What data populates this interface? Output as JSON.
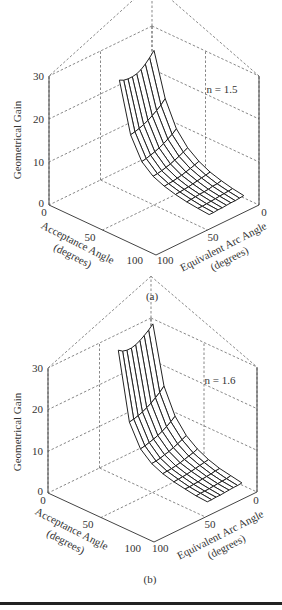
{
  "chart_data": [
    {
      "id": "a",
      "type": "surface3d",
      "caption": "(a)",
      "annotation": "n = 1.5",
      "zlabel": "Geometrical Gain",
      "xlabel": "Acceptance Angle (degrees)",
      "ylabel": "Equivalent Arc Angle (degrees)",
      "zticks": [
        0,
        10,
        20,
        30
      ],
      "xticks": [
        0,
        50,
        100
      ],
      "yticks": [
        0,
        50,
        100
      ],
      "zlim": [
        0,
        30
      ],
      "xlim": [
        0,
        100
      ],
      "ylim": [
        0,
        100
      ],
      "grid": true,
      "acceptance_angles": [
        10,
        20,
        30,
        40,
        50,
        60,
        70,
        80,
        90
      ],
      "arc_angles": [
        0,
        10,
        20,
        30,
        40,
        50,
        60,
        70,
        80
      ],
      "surface_note": "Gain decreases with acceptance angle; ~23 at smallest acceptance, ~11 near 30°, ~2–5 at large acceptance angles",
      "gain_rows": [
        [
          23.0,
          22.5,
          22.3,
          22.3,
          22.5,
          23.0,
          23.8,
          24.8,
          26.0
        ],
        [
          11.5,
          11.7,
          12.0,
          12.4,
          12.9,
          13.5,
          14.2,
          15.0,
          16.0
        ],
        [
          6.5,
          6.7,
          7.0,
          7.3,
          7.7,
          8.2,
          8.8,
          9.4,
          10.2
        ],
        [
          4.3,
          4.4,
          4.6,
          4.9,
          5.2,
          5.6,
          6.0,
          6.5,
          7.0
        ],
        [
          3.2,
          3.3,
          3.4,
          3.6,
          3.8,
          4.1,
          4.4,
          4.7,
          5.1
        ],
        [
          2.5,
          2.6,
          2.7,
          2.8,
          3.0,
          3.2,
          3.4,
          3.6,
          3.8
        ],
        [
          2.0,
          2.1,
          2.2,
          2.3,
          2.4,
          2.5,
          2.7,
          2.8,
          3.0
        ],
        [
          1.7,
          1.7,
          1.8,
          1.9,
          2.0,
          2.1,
          2.2,
          2.3,
          2.4
        ],
        [
          1.5,
          1.5,
          1.6,
          1.6,
          1.7,
          1.8,
          1.8,
          1.9,
          2.0
        ]
      ]
    },
    {
      "id": "b",
      "type": "surface3d",
      "caption": "(b)",
      "annotation": "n = 1.6",
      "zlabel": "Geometrical Gain",
      "xlabel": "Acceptance Angle (degrees)",
      "ylabel": "Equivalent Arc Angle (degrees)",
      "zticks": [
        0,
        10,
        20,
        30
      ],
      "xticks": [
        0,
        50,
        100
      ],
      "yticks": [
        0,
        50,
        100
      ],
      "zlim": [
        0,
        30
      ],
      "xlim": [
        0,
        100
      ],
      "ylim": [
        0,
        100
      ],
      "grid": true,
      "acceptance_angles": [
        10,
        20,
        30,
        40,
        50,
        60,
        70,
        80,
        90
      ],
      "arc_angles": [
        0,
        10,
        20,
        30,
        40,
        50,
        60,
        70,
        80
      ],
      "surface_note": "Gain decreases with acceptance angle; ~28 at smallest acceptance, ~12 near 30°, ~2–5 at large acceptance angles",
      "gain_rows": [
        [
          28.0,
          27.3,
          27.0,
          27.0,
          27.3,
          27.8,
          28.5,
          29.3,
          30.3
        ],
        [
          12.0,
          12.2,
          12.5,
          12.9,
          13.4,
          14.0,
          14.8,
          15.6,
          16.6
        ],
        [
          6.8,
          7.0,
          7.3,
          7.6,
          8.0,
          8.5,
          9.1,
          9.8,
          10.6
        ],
        [
          4.5,
          4.6,
          4.8,
          5.1,
          5.4,
          5.8,
          6.2,
          6.7,
          7.2
        ],
        [
          3.3,
          3.4,
          3.5,
          3.7,
          3.9,
          4.2,
          4.5,
          4.8,
          5.2
        ],
        [
          2.6,
          2.7,
          2.8,
          2.9,
          3.1,
          3.3,
          3.5,
          3.7,
          3.9
        ],
        [
          2.1,
          2.1,
          2.2,
          2.3,
          2.5,
          2.6,
          2.7,
          2.9,
          3.0
        ],
        [
          1.7,
          1.8,
          1.8,
          1.9,
          2.0,
          2.1,
          2.2,
          2.3,
          2.5
        ],
        [
          1.5,
          1.5,
          1.6,
          1.6,
          1.7,
          1.8,
          1.9,
          1.9,
          2.0
        ]
      ]
    }
  ],
  "labels": {
    "zlabel": "Geometrical Gain",
    "acceptance_title": "Acceptance Angle",
    "acceptance_units": "(degrees)",
    "arc_title": "Equivalent Arc Angle",
    "arc_units": "(degrees)",
    "tick_0": "0",
    "tick_10": "10",
    "tick_20": "20",
    "tick_30": "30",
    "tick_50": "50",
    "tick_100": "100"
  },
  "panels": [
    {
      "annotation": "n = 1.5",
      "caption": "(a)"
    },
    {
      "annotation": "n = 1.6",
      "caption": "(b)"
    }
  ]
}
